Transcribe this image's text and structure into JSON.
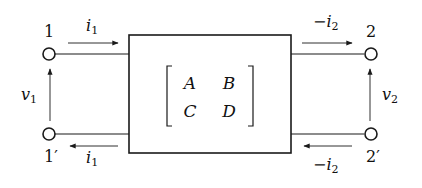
{
  "diagram": {
    "terminals": {
      "port1_top": "1",
      "port1_bottom": "1′",
      "port2_top": "2",
      "port2_bottom": "2′"
    },
    "currents": {
      "port1_top": {
        "base": "i",
        "sub": "1",
        "prefix": ""
      },
      "port1_bottom": {
        "base": "i",
        "sub": "1",
        "prefix": ""
      },
      "port2_top": {
        "base": "i",
        "sub": "2",
        "prefix": "−"
      },
      "port2_bottom": {
        "base": "i",
        "sub": "2",
        "prefix": "−"
      }
    },
    "voltages": {
      "port1": {
        "base": "v",
        "sub": "1"
      },
      "port2": {
        "base": "v",
        "sub": "2"
      }
    },
    "matrix": {
      "a": "A",
      "b": "B",
      "c": "C",
      "d": "D"
    },
    "colors": {
      "stroke": "#1a1a1a",
      "background": "#ffffff"
    }
  }
}
